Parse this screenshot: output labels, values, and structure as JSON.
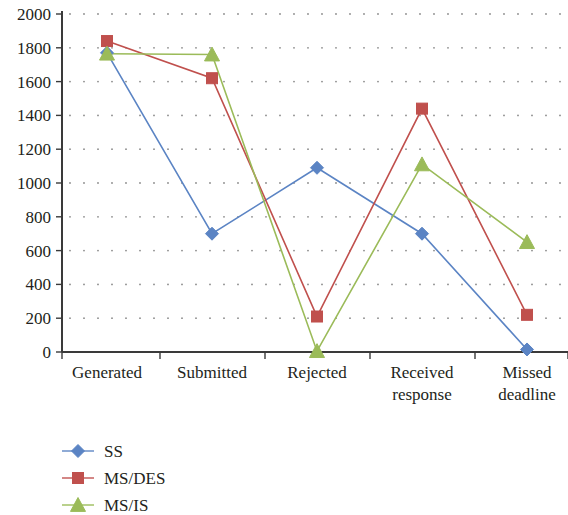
{
  "chart_data": {
    "type": "line",
    "title": "",
    "subtitle": "",
    "xlabel": "",
    "ylabel": "",
    "categories": [
      "Generated",
      "Submitted",
      "Rejected",
      "Received response",
      "Missed deadline"
    ],
    "category_lines": [
      [
        "Generated"
      ],
      [
        "Submitted"
      ],
      [
        "Rejected"
      ],
      [
        "Received",
        "response"
      ],
      [
        "Missed",
        "deadline"
      ]
    ],
    "series": [
      {
        "name": "SS",
        "color": "#5B84C4",
        "marker": "diamond",
        "values": [
          1770,
          700,
          1090,
          700,
          15
        ]
      },
      {
        "name": "MS/DES",
        "color": "#C0504D",
        "marker": "square",
        "values": [
          1840,
          1620,
          210,
          1440,
          220
        ]
      },
      {
        "name": "MS/IS",
        "color": "#9BBB59",
        "marker": "triangle",
        "values": [
          1765,
          1760,
          5,
          1110,
          650
        ]
      }
    ],
    "ylim": [
      0,
      2000
    ],
    "ytick_values": [
      0,
      200,
      400,
      600,
      800,
      1000,
      1200,
      1400,
      1600,
      1800,
      2000
    ],
    "ytick_labels": [
      "0",
      "200",
      "400",
      "600",
      "800",
      "1000",
      "1200",
      "1400",
      "1600",
      "1800",
      "2000"
    ],
    "grid": "dotted-horizontal",
    "legend_position": "bottom-left",
    "legend": [
      "SS",
      "MS/DES",
      "MS/IS"
    ]
  }
}
